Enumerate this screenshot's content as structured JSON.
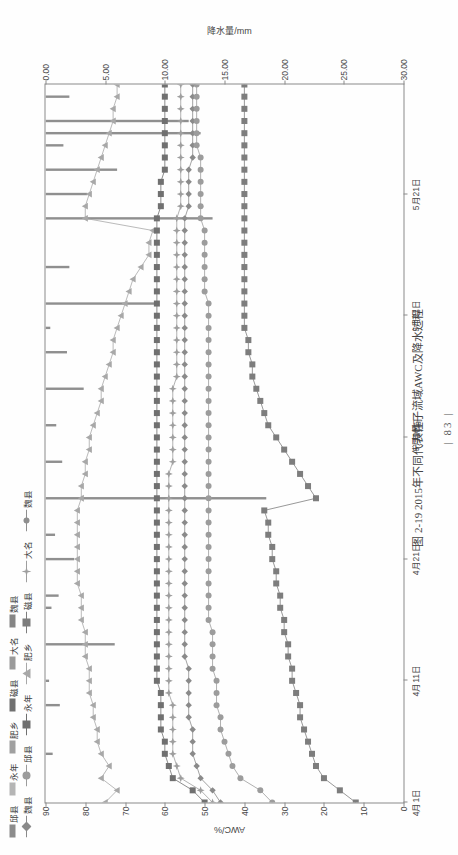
{
  "page": {
    "page_number": "83",
    "caption": "图 2-19  2015年不同代表性子流域AWC及降水过程"
  },
  "legend": {
    "bars_row": [
      {
        "label": "邱县",
        "color": "#8c8c8c"
      },
      {
        "label": "永年",
        "color": "#b5b5b5"
      },
      {
        "label": "肥乡",
        "color": "#a0a0a0"
      },
      {
        "label": "磁县",
        "color": "#707070"
      },
      {
        "label": "大名",
        "color": "#9a9a9a"
      },
      {
        "label": "魏县",
        "color": "#858585"
      }
    ],
    "lines_row": [
      {
        "label": "魏县",
        "color": "#8a8a8a",
        "marker": "diamond"
      },
      {
        "label": "邱县",
        "color": "#9c9c9c",
        "marker": "circle"
      },
      {
        "label": "永年",
        "color": "#707070",
        "marker": "square"
      },
      {
        "label": "肥乡",
        "color": "#a8a8a8",
        "marker": "triangle"
      },
      {
        "label": "磁县",
        "color": "#7d7d7d",
        "marker": "square-fill"
      },
      {
        "label": "大名",
        "color": "#9e9e9e",
        "marker": "star"
      },
      {
        "label": "魏县",
        "color": "#8f8f8f",
        "marker": "dot"
      }
    ]
  },
  "chart_data": {
    "type": "line",
    "title": "图 2-19  2015年不同代表性子流域AWC及降水过程",
    "xlabel": "时间",
    "ylabel": "AWC/%",
    "y2label": "降水量/mm",
    "ylim": [
      0,
      90
    ],
    "y2lim": [
      30,
      0
    ],
    "yticks": [
      "0",
      "10",
      "20",
      "30",
      "40",
      "50",
      "60",
      "70",
      "80",
      "90"
    ],
    "y2ticks": [
      "30.00",
      "25.00",
      "20.00",
      "15.00",
      "10.00",
      "5.00",
      "0.00"
    ],
    "xticks": [
      "4月1日",
      "4月11日",
      "4月21日",
      "5月1日",
      "5月11日",
      "5月21日"
    ],
    "grid": false,
    "legend_position": "top",
    "x": [
      0,
      1,
      2,
      3,
      4,
      5,
      6,
      7,
      8,
      9,
      10,
      11,
      12,
      13,
      14,
      15,
      16,
      17,
      18,
      19,
      20,
      21,
      22,
      23,
      24,
      25,
      26,
      27,
      28,
      29,
      30,
      31,
      32,
      33,
      34,
      35,
      36,
      37,
      38,
      39,
      40,
      41,
      42,
      43,
      44,
      45,
      46,
      47,
      48,
      49,
      50,
      51,
      52,
      53,
      54,
      55,
      56,
      57,
      58,
      59
    ],
    "series": [
      {
        "name": "邱县",
        "axis": "left",
        "marker": "triangle",
        "color": "#a8a8a8",
        "values": [
          75,
          72,
          76,
          74,
          76,
          77,
          77,
          78,
          78,
          79,
          79,
          79,
          80,
          80,
          80,
          81,
          81,
          81,
          82,
          82,
          82,
          82,
          82,
          82,
          82,
          81,
          81,
          80,
          80,
          79,
          79,
          78,
          77,
          76,
          76,
          75,
          74,
          73,
          73,
          72,
          71,
          70,
          69,
          68,
          66,
          64,
          64,
          63,
          80,
          80,
          79,
          78,
          77,
          76,
          75,
          74,
          73,
          73,
          72,
          72
        ]
      },
      {
        "name": "永年",
        "axis": "left",
        "marker": "square",
        "color": "#707070",
        "values": [
          50,
          53,
          58,
          59,
          60,
          60,
          61,
          61,
          61,
          61,
          62,
          62,
          62,
          62,
          62,
          62,
          62,
          62,
          62,
          62,
          62,
          62,
          62,
          62,
          62,
          62,
          62,
          62,
          62,
          62,
          62,
          62,
          62,
          62,
          62,
          62,
          62,
          62,
          62,
          62,
          62,
          62,
          62,
          62,
          62,
          62,
          62,
          62,
          62,
          61,
          61,
          61,
          60,
          60,
          60,
          60,
          60,
          60,
          60,
          60
        ]
      },
      {
        "name": "肥乡",
        "axis": "left",
        "marker": "star",
        "color": "#9e9e9e",
        "values": [
          48,
          51,
          56,
          57,
          58,
          58,
          58,
          58,
          58,
          59,
          59,
          59,
          59,
          59,
          59,
          59,
          59,
          59,
          59,
          59,
          59,
          59,
          59,
          59,
          59,
          59,
          59,
          59,
          58,
          58,
          58,
          58,
          58,
          58,
          58,
          57,
          57,
          57,
          57,
          57,
          57,
          57,
          57,
          57,
          57,
          57,
          57,
          57,
          57,
          56,
          56,
          56,
          56,
          56,
          56,
          56,
          56,
          56,
          56,
          56
        ]
      },
      {
        "name": "磁县",
        "axis": "left",
        "marker": "diamond",
        "color": "#8a8a8a",
        "values": [
          46,
          48,
          51,
          52,
          53,
          53,
          53,
          54,
          54,
          54,
          54,
          54,
          55,
          55,
          55,
          55,
          55,
          55,
          55,
          55,
          55,
          55,
          55,
          55,
          55,
          55,
          55,
          55,
          55,
          55,
          55,
          55,
          55,
          55,
          55,
          55,
          55,
          55,
          55,
          55,
          55,
          55,
          55,
          55,
          55,
          55,
          55,
          55,
          55,
          54,
          54,
          54,
          54,
          53,
          53,
          53,
          53,
          53,
          53,
          53
        ]
      },
      {
        "name": "大名",
        "axis": "left",
        "marker": "circle",
        "color": "#9c9c9c",
        "values": [
          33,
          36,
          41,
          43,
          44,
          45,
          46,
          46,
          47,
          47,
          47,
          48,
          48,
          48,
          48,
          49,
          49,
          49,
          49,
          49,
          49,
          49,
          49,
          49,
          49,
          49,
          49,
          49,
          49,
          49,
          49,
          49,
          49,
          49,
          49,
          49,
          49,
          49,
          49,
          49,
          49,
          49,
          50,
          50,
          50,
          50,
          50,
          50,
          51,
          51,
          51,
          51,
          51,
          51,
          52,
          52,
          52,
          52,
          52,
          52
        ]
      },
      {
        "name": "魏县",
        "axis": "left",
        "marker": "square-fill",
        "color": "#7d7d7d",
        "values": [
          12,
          16,
          20,
          22,
          23,
          24,
          25,
          26,
          26,
          27,
          28,
          28,
          29,
          29,
          30,
          30,
          31,
          31,
          32,
          32,
          33,
          33,
          34,
          34,
          35,
          22,
          24,
          26,
          28,
          30,
          32,
          34,
          35,
          36,
          37,
          38,
          38,
          39,
          39,
          40,
          40,
          40,
          40,
          40,
          40,
          40,
          40,
          40,
          40,
          40,
          40,
          40,
          40,
          40,
          40,
          40,
          40,
          40,
          40,
          40
        ]
      }
    ],
    "precipitation_bars": {
      "name": "降水量",
      "axis": "right",
      "unit": "mm",
      "values": [
        0,
        0,
        0,
        0,
        0.6,
        0,
        0,
        0,
        1.2,
        0,
        0.3,
        0,
        0,
        5.8,
        0,
        0,
        0.5,
        1.1,
        0,
        0,
        2.4,
        0,
        0.8,
        0,
        0,
        18.5,
        0,
        0,
        1.4,
        0,
        0,
        0.9,
        0,
        0,
        3.2,
        0,
        0,
        1.8,
        0,
        0.4,
        0,
        9.5,
        0,
        0,
        2.0,
        0,
        0,
        0,
        14.0,
        0,
        3.5,
        0,
        6.0,
        0,
        1.5,
        13.0,
        12.0,
        0,
        2.0,
        0
      ]
    }
  }
}
